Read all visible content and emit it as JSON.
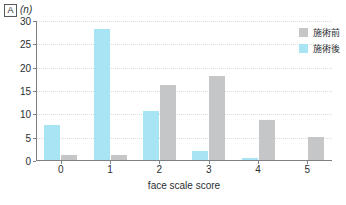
{
  "panel": {
    "tag": "A",
    "unit": "(n)"
  },
  "legend": {
    "position": "top-right",
    "entries": [
      {
        "label": "施術前",
        "color": "#c4c6c7",
        "name": "before"
      },
      {
        "label": "施術後",
        "color": "#a7e4f4",
        "name": "after"
      }
    ]
  },
  "chart_data": {
    "type": "bar",
    "title": "",
    "subtitle": "",
    "xlabel": "face scale score",
    "ylabel": "(n)",
    "categories": [
      "0",
      "1",
      "2",
      "3",
      "4",
      "5"
    ],
    "series": [
      {
        "name": "施術後",
        "color": "#a7e4f4",
        "values": [
          7.5,
          28,
          10.5,
          2,
          0.5,
          0
        ]
      },
      {
        "name": "施術前",
        "color": "#c4c6c7",
        "values": [
          1,
          1,
          16,
          18,
          8.5,
          5
        ]
      }
    ],
    "ylim": [
      0,
      30
    ],
    "yticks": [
      0,
      5,
      10,
      15,
      20,
      25,
      30
    ],
    "ytick_labels": [
      "0",
      "5",
      "10",
      "15",
      "20",
      "25",
      "30"
    ],
    "xtick_labels": [
      "0",
      "1",
      "2",
      "3",
      "4",
      "5"
    ],
    "grid": true,
    "grid_axis": "y",
    "legend_position": "top-right"
  }
}
